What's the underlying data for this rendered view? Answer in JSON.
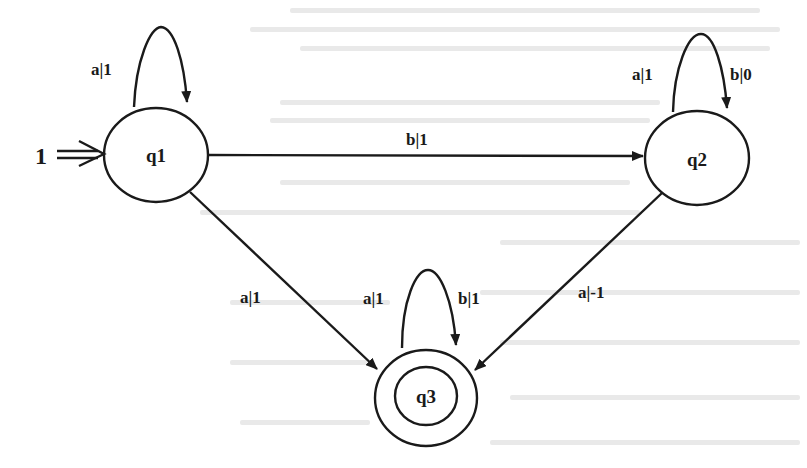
{
  "diagram": {
    "type": "weighted-automaton",
    "states": [
      {
        "id": "q1",
        "label": "q1",
        "initial": true,
        "initial_weight": "1",
        "final": false
      },
      {
        "id": "q2",
        "label": "q2",
        "initial": false,
        "final": false
      },
      {
        "id": "q3",
        "label": "q3",
        "initial": false,
        "final": true
      }
    ],
    "initial_arrow": {
      "label": "1",
      "symbol": "⇒"
    },
    "transitions": [
      {
        "from": "q1",
        "to": "q1",
        "label": "a|1"
      },
      {
        "from": "q1",
        "to": "q2",
        "label": "b|1"
      },
      {
        "from": "q1",
        "to": "q3",
        "label": "a|1"
      },
      {
        "from": "q2",
        "to": "q2",
        "label": "a|1"
      },
      {
        "from": "q2",
        "to": "q2",
        "label_b": "b|0"
      },
      {
        "from": "q2",
        "to": "q3",
        "label": "a|-1"
      },
      {
        "from": "q3",
        "to": "q3",
        "label": "a|1"
      },
      {
        "from": "q3",
        "to": "q3",
        "label_b": "b|1"
      }
    ]
  },
  "labels": {
    "init": "1",
    "q1": "q1",
    "q2": "q2",
    "q3": "q3",
    "q1_loop": "a|1",
    "q1_q2": "b|1",
    "q1_q3": "a|1",
    "q2_loop_a": "a|1",
    "q2_loop_b": "b|0",
    "q2_q3": "a|-1",
    "q3_loop_a": "a|1",
    "q3_loop_b": "b|1"
  },
  "colors": {
    "ink": "#1a1a1a",
    "background": "#ffffff"
  }
}
